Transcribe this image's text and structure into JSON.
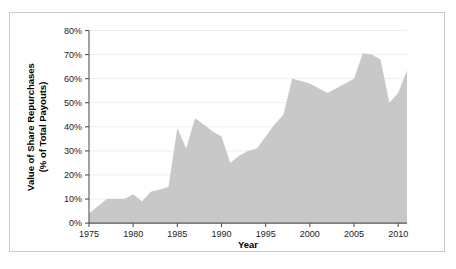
{
  "figure": {
    "border_color": "#c9c9c9",
    "background": "#ffffff"
  },
  "chart_data": {
    "type": "area",
    "title": "",
    "xlabel": "Year",
    "ylabel": "Value of Share Repurchases\n(% of Total Payouts)",
    "ylabel_line1": "Value of Share Repurchases",
    "ylabel_line2": "(% of Total Payouts)",
    "series_name": "Value of Share Repurchases",
    "fill_color": "#c8c8c8",
    "grid": true,
    "grid_axis": "y",
    "legend": "none",
    "xlim": [
      1975,
      2011
    ],
    "ylim": [
      0,
      80
    ],
    "xticks": [
      1975,
      1980,
      1985,
      1990,
      1995,
      2000,
      2005,
      2010
    ],
    "xtick_labels": [
      "1975",
      "1980",
      "1985",
      "1990",
      "1995",
      "2000",
      "2005",
      "2010"
    ],
    "yticks": [
      0,
      10,
      20,
      30,
      40,
      50,
      60,
      70,
      80
    ],
    "ytick_labels": [
      "0%",
      "10%",
      "20%",
      "30%",
      "40%",
      "50%",
      "60%",
      "70%",
      "80%"
    ],
    "x": [
      1975,
      1976,
      1977,
      1978,
      1979,
      1980,
      1981,
      1982,
      1983,
      1984,
      1985,
      1986,
      1987,
      1988,
      1989,
      1990,
      1991,
      1992,
      1993,
      1994,
      1995,
      1996,
      1997,
      1998,
      1999,
      2000,
      2001,
      2002,
      2003,
      2004,
      2005,
      2006,
      2007,
      2008,
      2009,
      2010,
      2011
    ],
    "values": [
      4,
      7,
      10,
      10,
      10,
      12,
      9,
      13,
      14,
      15,
      39.5,
      31,
      43.5,
      41,
      38,
      36,
      25,
      28,
      30,
      31,
      36,
      41,
      45,
      60,
      59,
      58,
      56,
      54,
      56,
      58,
      60,
      70.5,
      70,
      68,
      50,
      54,
      63.5
    ]
  }
}
